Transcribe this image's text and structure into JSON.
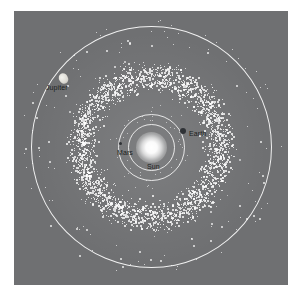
{
  "figure": {
    "kind": "astronomy-illustration",
    "background_color": "#ffffff",
    "panel_color": "#6f7072",
    "asteroid_color": "#ffffff",
    "orbit_color": "#ffffff",
    "label_color": "#1b1d20"
  },
  "labels": {
    "jupiter": "Jupiter",
    "earth": "Earth",
    "mars": "Mars",
    "sun": "Sun"
  },
  "icons": {
    "sun": "sun-glow-icon",
    "jupiter": "jupiter-planet-icon",
    "earth": "earth-planet-icon",
    "mars": "mars-planet-icon"
  },
  "chart_data": {
    "type": "scatter",
    "title": "",
    "xlabel": "",
    "ylabel": "",
    "projection": "top-down ecliptic plane",
    "center": {
      "x": 137,
      "y": 136,
      "body": "Sun"
    },
    "orbits": [
      {
        "name": "Earth",
        "radius_px": 23,
        "stroke": "#ffffff"
      },
      {
        "name": "Mars",
        "radius_px": 33,
        "stroke": "#ffffff"
      },
      {
        "name": "Jupiter",
        "radius_px": 120,
        "stroke": "#ffffff"
      }
    ],
    "bodies": [
      {
        "name": "Sun",
        "x": 137,
        "y": 136,
        "r": 15,
        "color": "#ffffff",
        "label_dx": -4,
        "label_dy": 16
      },
      {
        "name": "Earth",
        "x": 169,
        "y": 120,
        "r": 3,
        "color": "#2f3236",
        "label_dx": 9,
        "label_dy": -1
      },
      {
        "name": "Mars",
        "x": 106,
        "y": 132,
        "r": 1.6,
        "color": "#2f3236",
        "label_dx": -3,
        "label_dy": 6
      },
      {
        "name": "Jupiter",
        "x": 49,
        "y": 67,
        "r": 5,
        "color": "#eceae4",
        "label_dx": -17,
        "label_dy": 6
      }
    ],
    "belt": {
      "name": "Main asteroid belt",
      "inner_radius_px": 44,
      "outer_radius_px": 98,
      "peak_radius_px": 68,
      "count": 2600,
      "dot_size_px": [
        1,
        2
      ],
      "scatter_outliers": 120,
      "outlier_max_radius_px": 132
    },
    "grid": false,
    "legend": null
  }
}
